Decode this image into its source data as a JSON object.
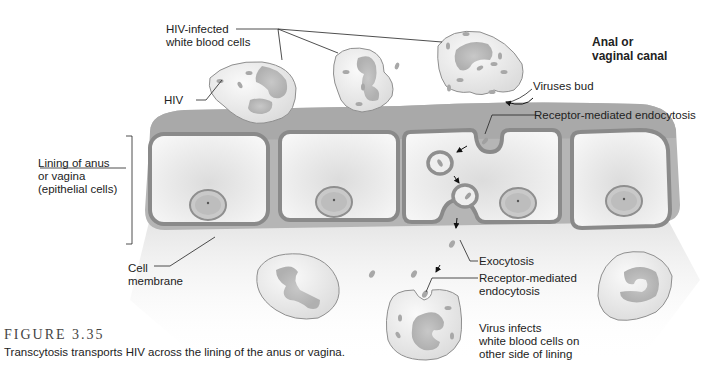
{
  "figure": {
    "number": "FIGURE 3.35",
    "caption": "Transcytosis transports HIV across the lining of the anus or vagina."
  },
  "labels": {
    "hiv_infected_cells": "HIV-infected\nwhite blood cells",
    "hiv": "HIV",
    "canal": "Anal or\nvaginal canal",
    "viruses_bud": "Viruses bud",
    "rme_top": "Receptor-mediated endocytosis",
    "lining": "Lining of anus\nor vagina\n(epithelial cells)",
    "cell_membrane": "Cell\nmembrane",
    "exocytosis": "Exocytosis",
    "rme_bottom": "Receptor-mediated\nendocytosis",
    "virus_infects": "Virus infects\nwhite blood cells on\nother side of lining"
  },
  "colors": {
    "membrane": "#8f8f8f",
    "membrane_top": "#a8a8a8",
    "cytoplasm": "#f2f2f2",
    "cell_fill": "#e6e6e6",
    "nucleus": "#a3a3a3",
    "virus": "#9c9c9c",
    "text": "#222222"
  }
}
